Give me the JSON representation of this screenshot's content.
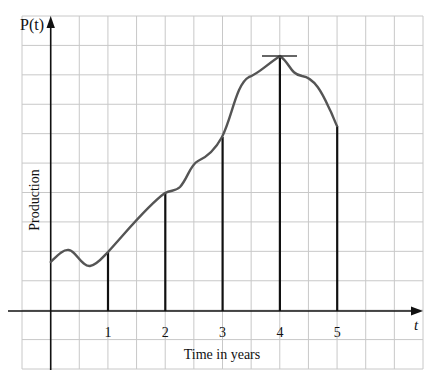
{
  "chart_data": {
    "type": "line",
    "title": "",
    "xlabel": "Time in years",
    "ylabel": "Production",
    "y_axis_label": "P(t)",
    "x_axis_label": "t",
    "x_ticks": [
      "1",
      "2",
      "3",
      "4",
      "5"
    ],
    "xlim": [
      0,
      5
    ],
    "ylim_grid_units": [
      0,
      10
    ],
    "grid": true,
    "legend": null,
    "series": [
      {
        "name": "P(t)",
        "x": [
          0,
          0.3,
          0.7,
          1,
          1.5,
          2,
          2.2,
          2.5,
          3,
          3.3,
          3.5,
          3.75,
          4,
          4.25,
          4.5,
          4.75,
          5
        ],
        "values": [
          1.66,
          2.07,
          1.53,
          2.0,
          3.0,
          4.0,
          4.2,
          5.0,
          5.9,
          7.3,
          8.0,
          8.2,
          8.65,
          8.0,
          7.7,
          6.9,
          6.27
        ]
      }
    ],
    "annotations": [
      {
        "type": "vertical_lines",
        "at_t": [
          1,
          2,
          3,
          4,
          5
        ],
        "description": "Vertical segments from t-axis up to curve at each integer year"
      },
      {
        "type": "horizontal_tangent",
        "at_t": 4,
        "description": "Horizontal tangent line at the maximum point t=4"
      }
    ]
  },
  "labels": {
    "y_axis": "P(t)",
    "x_axis": "t",
    "ylabel": "Production",
    "xlabel": "Time in years",
    "ticks": [
      "1",
      "2",
      "3",
      "4",
      "5"
    ]
  }
}
